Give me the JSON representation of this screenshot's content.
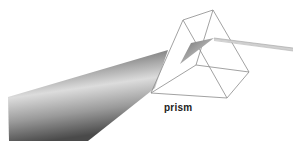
{
  "diagram": {
    "labels": {
      "prism": "prism"
    },
    "elements": {
      "incident_beam": "wide light beam entering prism",
      "prism": "triangular glass prism (wireframe)",
      "internal_beam": "refracted beam inside prism",
      "exit_beam": "narrow beam exiting prism"
    },
    "colors": {
      "background": "#ffffff",
      "prism_edge": "#8a8a8a",
      "beam_dark": "#4a4a4a",
      "beam_light": "#d8d8d8",
      "label": "#222222"
    }
  }
}
